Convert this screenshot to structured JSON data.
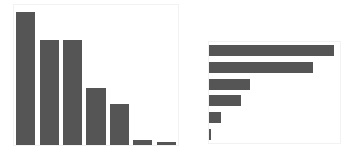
{
  "figure": {
    "background_color": "#ffffff",
    "bar_color": "#555555",
    "axes_border_color": "#f2f2f2",
    "panel_count": 2
  },
  "chart_data": [
    {
      "type": "bar",
      "orientation": "vertical",
      "title": "",
      "subtitle": "",
      "xlabel": "",
      "ylabel": "",
      "grid": false,
      "legend": false,
      "legend_position": "none",
      "categories": [
        "1",
        "2",
        "3",
        "4",
        "5",
        "6",
        "7"
      ],
      "tick_labels_x": [],
      "tick_labels_y": [],
      "values": [
        100,
        79,
        79,
        43,
        31,
        3.5,
        2
      ],
      "ylim": [
        0,
        105
      ],
      "series": [
        {
          "name": "series-1",
          "color": "#555555",
          "values": [
            100,
            79,
            79,
            43,
            31,
            3.5,
            2
          ]
        }
      ],
      "annotations": []
    },
    {
      "type": "bar",
      "orientation": "horizontal",
      "title": "",
      "subtitle": "",
      "xlabel": "",
      "ylabel": "",
      "grid": false,
      "legend": false,
      "legend_position": "none",
      "categories": [
        "1",
        "2",
        "3",
        "4",
        "5",
        "6"
      ],
      "tick_labels_x": [],
      "tick_labels_y": [],
      "values": [
        100,
        83,
        33,
        26,
        10,
        1.5
      ],
      "xlim": [
        0,
        105
      ],
      "series": [
        {
          "name": "series-1",
          "color": "#555555",
          "values": [
            100,
            83,
            33,
            26,
            10,
            1.5
          ]
        }
      ],
      "annotations": []
    }
  ]
}
